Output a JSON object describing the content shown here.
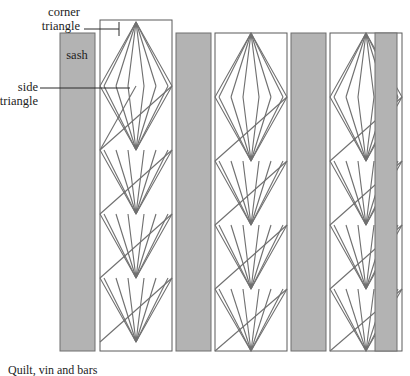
{
  "figure": {
    "caption": "Quilt, vin and bars",
    "colors": {
      "sash_fill": "#b3b3b3",
      "sash_stroke": "#6e6e6e",
      "panel_fill": "#ffffff",
      "panel_stroke": "#5a5a5a",
      "lattice_stroke": "#707070",
      "leader_stroke": "#2a2a2a",
      "text": "#1d1d1d",
      "background": "#ffffff"
    },
    "labels": {
      "corner_triangle": {
        "line1": "corner",
        "line2": "triangle"
      },
      "side_triangle": {
        "line1": "side",
        "line2": "triangle"
      },
      "sash": "sash"
    },
    "geometry": {
      "columns": [
        {
          "name": "sash-column-1",
          "type": "sash",
          "x": 60,
          "width": 35
        },
        {
          "name": "lattice-column-1",
          "type": "lattice",
          "x": 100,
          "width": 72
        },
        {
          "name": "sash-column-2",
          "type": "sash",
          "x": 176,
          "width": 35
        },
        {
          "name": "lattice-column-2",
          "type": "lattice",
          "x": 215,
          "width": 72
        },
        {
          "name": "sash-column-3",
          "type": "sash",
          "x": 291,
          "width": 35
        },
        {
          "name": "lattice-column-3",
          "type": "lattice",
          "x": 330,
          "width": 72
        },
        {
          "name": "sash-column-4",
          "type": "sash",
          "x": 375,
          "width": 22
        }
      ],
      "panel_top": 33,
      "panel_bottom": 351,
      "diamond_count": 5,
      "radiating_lines_per_half": 5
    }
  }
}
